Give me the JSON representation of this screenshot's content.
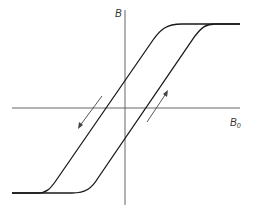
{
  "diagram": {
    "axes": {
      "y_label": "B",
      "x_label": "B",
      "x_label_subscript": "0"
    },
    "colors": {
      "curve": "#1a1a1a",
      "axis": "#555555",
      "arrow": "#444444",
      "background": "#ffffff"
    },
    "annotations": [
      {
        "type": "arrow",
        "direction": "down-left",
        "meaning": "decreasing field branch"
      },
      {
        "type": "arrow",
        "direction": "up-right",
        "meaning": "increasing field branch"
      }
    ]
  }
}
